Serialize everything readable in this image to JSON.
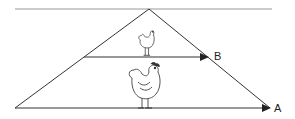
{
  "diagram": {
    "type": "triangle-with-arrows",
    "labels": {
      "arrow_a": "A",
      "arrow_b": "B"
    },
    "elements": {
      "top_line": "horizontal reference line",
      "apex": "vertex point",
      "arrow_a": "long base arrow",
      "arrow_b": "short middle arrow",
      "small_chicken": "small chicken standing on arrow B",
      "large_chicken": "large chicken standing on arrow A"
    },
    "colors": {
      "line": "#333333",
      "top_line": "#9a9a9a",
      "background": "#ffffff"
    }
  }
}
